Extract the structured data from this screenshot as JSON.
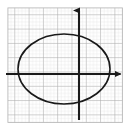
{
  "figure": {
    "title": "Ellipse graphed on coordinate grid",
    "width": 129,
    "height": 129,
    "background_color": "#ffffff"
  },
  "colors": {
    "background": "#ffffff",
    "grid_minor": "#d8d8d8",
    "grid_major": "#a8a8a8",
    "axis": "#1a1a1a",
    "curve": "#1a1a1a"
  },
  "chart_data": {
    "type": "scatter",
    "title": "",
    "subtitle": "",
    "xlabel": "",
    "ylabel": "",
    "xlim": [
      -5,
      3
    ],
    "ylim": [
      -3.2,
      4.8
    ],
    "grid": true,
    "grid_minor_spacing_px": 3.58,
    "grid_major_spacing_px": 14.3,
    "legend": null,
    "annotations": [],
    "tick_labels": {
      "x": [],
      "y": []
    },
    "axes": {
      "origin_px": [
        79,
        74
      ],
      "x_axis": {
        "y_px": 74,
        "start_px": 6,
        "end_px": 123,
        "arrow_start": false,
        "arrow_end": true
      },
      "y_axis": {
        "x_px": 79,
        "start_px": 6,
        "end_px": 120,
        "arrow_start": true,
        "arrow_end": false
      }
    },
    "grid_region_px": {
      "left": 8,
      "top": 8,
      "right": 122,
      "bottom": 122
    },
    "series": [
      {
        "name": "ellipse",
        "type": "ellipse",
        "center_px": [
          64,
          69
        ],
        "radius_x_px": 46,
        "radius_y_px": 35,
        "center_units": [
          -1.05,
          0.35
        ],
        "semi_axis_x_units": 3.2,
        "semi_axis_y_units": 2.45,
        "equation": "(x + 1.05)^2 / 3.2^2 + (y - 0.35)^2 / 2.45^2 = 1",
        "stroke_color": "#1a1a1a",
        "stroke_width_px": 1.6,
        "fill": "none"
      }
    ]
  }
}
